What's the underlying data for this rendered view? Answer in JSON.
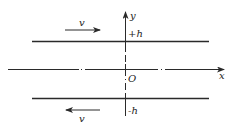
{
  "diagram": {
    "colors": {
      "line": "#2a2a2a",
      "text": "#222222",
      "background": "#ffffff"
    },
    "axes": {
      "x_label": "x",
      "y_label": "y",
      "origin_label": "O"
    },
    "plates": {
      "top": {
        "label": "+h",
        "velocity_label": "v",
        "velocity_direction": "right"
      },
      "bottom": {
        "label": "-h",
        "velocity_label": "v",
        "velocity_direction": "left"
      }
    }
  }
}
